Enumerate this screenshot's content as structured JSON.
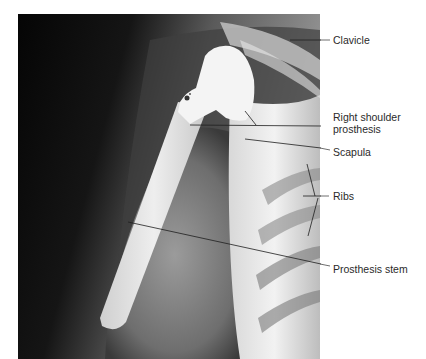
{
  "figure": {
    "image_description": "Radiograph of right shoulder with prosthesis",
    "colors": {
      "background": "#ffffff",
      "leader": "#1e1e1e",
      "label": "#2a2a2a"
    },
    "labels": [
      {
        "id": "clavicle",
        "text": "Clavicle"
      },
      {
        "id": "shoulder-prosthesis-1",
        "text": "Right shoulder"
      },
      {
        "id": "shoulder-prosthesis-2",
        "text": "prosthesis"
      },
      {
        "id": "scapula",
        "text": "Scapula"
      },
      {
        "id": "ribs",
        "text": "Ribs"
      },
      {
        "id": "prosthesis-stem",
        "text": "Prosthesis stem"
      }
    ]
  }
}
